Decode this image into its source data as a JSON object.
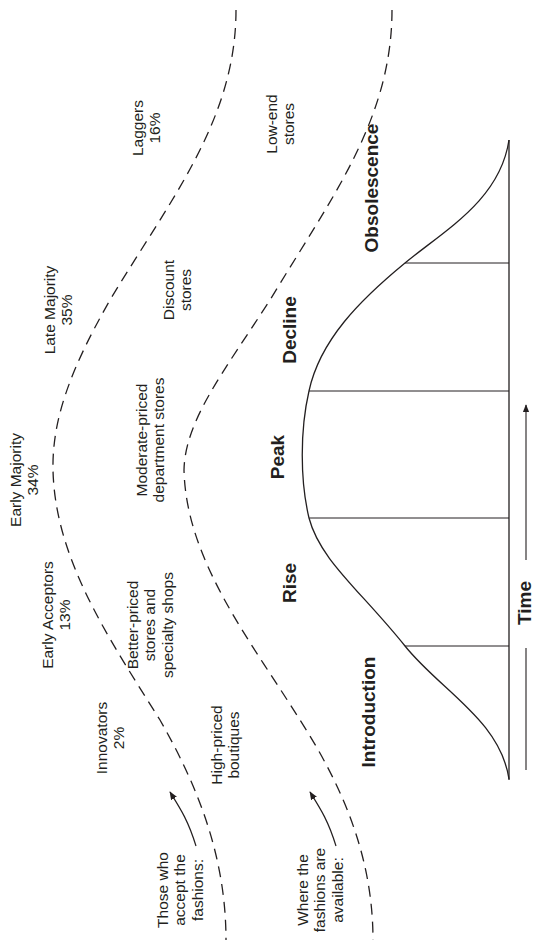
{
  "row_labels": {
    "acceptors": [
      "Those who",
      "accept the",
      "fashions:"
    ],
    "availability": [
      "Where the",
      "fashions are",
      "available:"
    ]
  },
  "consumer_groups": [
    {
      "name": "Innovators",
      "share": "2%"
    },
    {
      "name": "Early Acceptors",
      "share": "13%"
    },
    {
      "name": "Early Majority",
      "share": "34%"
    },
    {
      "name": "Late Majority",
      "share": "35%"
    },
    {
      "name": "Laggers",
      "share": "16%"
    }
  ],
  "retail_outlets": [
    {
      "lines": [
        "High-priced",
        "boutiques"
      ]
    },
    {
      "lines": [
        "Better-priced",
        "stores and",
        "specialty shops"
      ]
    },
    {
      "lines": [
        "Moderate-priced",
        "department stores"
      ]
    },
    {
      "lines": [
        "Discount",
        "stores"
      ]
    },
    {
      "lines": [
        "Low-end",
        "stores"
      ]
    }
  ],
  "stages": [
    "Introduction",
    "Rise",
    "Peak",
    "Decline",
    "Obsolescence"
  ],
  "axis": {
    "label": "Time"
  },
  "colors": {
    "line": "#231f20",
    "background": "#ffffff"
  }
}
